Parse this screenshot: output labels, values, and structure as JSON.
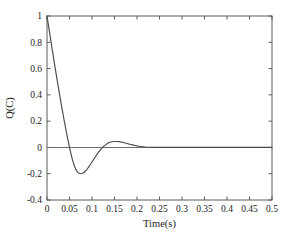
{
  "chart_data": {
    "type": "line",
    "title": "",
    "subtitle": "",
    "xlabel": "Time(s)",
    "ylabel": "Q(C)",
    "xlim": [
      0,
      0.5
    ],
    "ylim": [
      -0.4,
      1
    ],
    "grid": false,
    "legend": null,
    "legend_position": "none",
    "xticks": [
      0,
      0.05,
      0.1,
      0.15,
      0.2,
      0.25,
      0.3,
      0.35,
      0.4,
      0.45,
      0.5
    ],
    "xticklabels": [
      "0",
      "0.05",
      "0.1",
      "0.15",
      "0.2",
      "0.25",
      "0.3",
      "0.35",
      "0.4",
      "0.45",
      "0.5"
    ],
    "yticks": [
      -0.4,
      -0.2,
      0,
      0.2,
      0.4,
      0.6,
      0.8,
      1
    ],
    "yticklabels": [
      "-0.4",
      "-0.2",
      "0",
      "0.2",
      "0.4",
      "0.6",
      "0.8",
      "1"
    ],
    "annotations": [],
    "series": [
      {
        "name": "Q(C)",
        "color": "#4a4a4a",
        "x": [
          0,
          0.004,
          0.008,
          0.012,
          0.016,
          0.02,
          0.024,
          0.028,
          0.032,
          0.036,
          0.04,
          0.044,
          0.048,
          0.052,
          0.056,
          0.06,
          0.064,
          0.068,
          0.072,
          0.076,
          0.08,
          0.084,
          0.088,
          0.092,
          0.096,
          0.1,
          0.104,
          0.108,
          0.112,
          0.116,
          0.12,
          0.124,
          0.128,
          0.132,
          0.136,
          0.14,
          0.144,
          0.148,
          0.152,
          0.156,
          0.16,
          0.164,
          0.168,
          0.172,
          0.176,
          0.18,
          0.184,
          0.188,
          0.192,
          0.196,
          0.2,
          0.205,
          0.21,
          0.215,
          0.22,
          0.225,
          0.23,
          0.24,
          0.26,
          0.28,
          0.3,
          0.33,
          0.36,
          0.4,
          0.45,
          0.5
        ],
        "y": [
          1.0,
          0.912,
          0.824,
          0.737,
          0.651,
          0.566,
          0.483,
          0.402,
          0.322,
          0.245,
          0.171,
          0.1,
          0.033,
          -0.03,
          -0.087,
          -0.134,
          -0.167,
          -0.188,
          -0.198,
          -0.2,
          -0.195,
          -0.185,
          -0.17,
          -0.152,
          -0.132,
          -0.111,
          -0.09,
          -0.069,
          -0.049,
          -0.03,
          -0.013,
          0.002,
          0.014,
          0.025,
          0.033,
          0.039,
          0.043,
          0.045,
          0.0455,
          0.045,
          0.0437,
          0.0415,
          0.0387,
          0.0355,
          0.032,
          0.0283,
          0.0246,
          0.021,
          0.0176,
          0.0145,
          0.0117,
          0.0086,
          0.006,
          0.004,
          0.0025,
          0.0014,
          0.0007,
          0.0002,
          0.0,
          0.0,
          0.0,
          0.0,
          0.0,
          0.0,
          0.0,
          0.0
        ],
        "key_points": {
          "initial_value": 1.0,
          "first_zero_crossing": 0.048,
          "minimum": {
            "x": 0.076,
            "y": -0.2
          },
          "second_zero_crossing": 0.1225,
          "maximum_overshoot": {
            "x": 0.153,
            "y": 0.0455
          },
          "settling_time": 0.23
        }
      }
    ]
  },
  "geometry": {
    "left": 47,
    "right": 272,
    "top": 16,
    "bottom": 200
  }
}
